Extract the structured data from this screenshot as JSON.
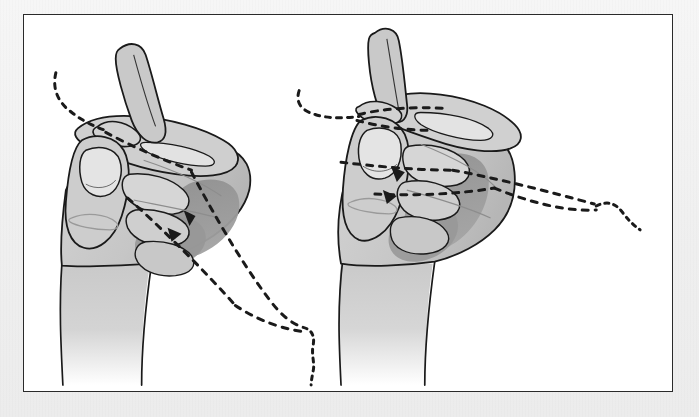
{
  "document": {
    "type": "instructional-line-drawing",
    "subject": "string figure hand positions",
    "panel_count": 2,
    "background_color": "#f0f0f0",
    "paper_color": "#ffffff",
    "frame_border_color": "#2a2a2a",
    "ink_color": "#1a1a1a"
  },
  "palette": {
    "ink": "#1a1a1a",
    "skin_light": "#dcdcdc",
    "skin_mid": "#c4c4c4",
    "skin_dark": "#9a9a9a",
    "shadow_deep": "#8c8c8c",
    "paper": "#ffffff",
    "page": "#f0f0f0"
  },
  "frame": {
    "x": 23,
    "y": 14,
    "width": 650,
    "height": 378,
    "border_width": 1.6
  },
  "figures": [
    {
      "id": "left-hand-figure",
      "label": "Left hand holding string loop",
      "hand": "left",
      "pose": "closed fist with thumb and index extended",
      "string_entry": "upper-left",
      "string_exit": "lower-right",
      "shadow_present": true
    },
    {
      "id": "right-hand-figure",
      "label": "Right hand holding string loop",
      "hand": "right",
      "pose": "closed fist with thumb up and index extended",
      "string_entry": "left",
      "string_exit": "right",
      "shadow_present": true
    }
  ],
  "strings": [
    {
      "id": "left-string-in",
      "style": "dashed",
      "description": "string entering from upper left to thumb tip"
    },
    {
      "id": "left-string-through",
      "style": "dashed",
      "description": "string crossing palm diagonally"
    },
    {
      "id": "left-string-out-upper",
      "style": "dashed",
      "description": "string exiting lower right upper strand"
    },
    {
      "id": "left-string-out-lower",
      "style": "dashed",
      "description": "string exiting lower right lower strand"
    },
    {
      "id": "left-string-tail",
      "style": "dashed-wavy",
      "description": "hanging wavy tail end of string"
    },
    {
      "id": "right-string-in",
      "style": "dashed",
      "description": "string entering from left across index finger"
    },
    {
      "id": "right-string-mid",
      "style": "dashed",
      "description": "string across middle knuckles"
    },
    {
      "id": "right-string-out-upper",
      "style": "dashed",
      "description": "string exiting right upper strand"
    },
    {
      "id": "right-string-out-lower",
      "style": "dashed",
      "description": "string exiting right lower strand"
    },
    {
      "id": "right-string-tail",
      "style": "dashed-wavy",
      "description": "hanging wavy tail end of string"
    }
  ]
}
